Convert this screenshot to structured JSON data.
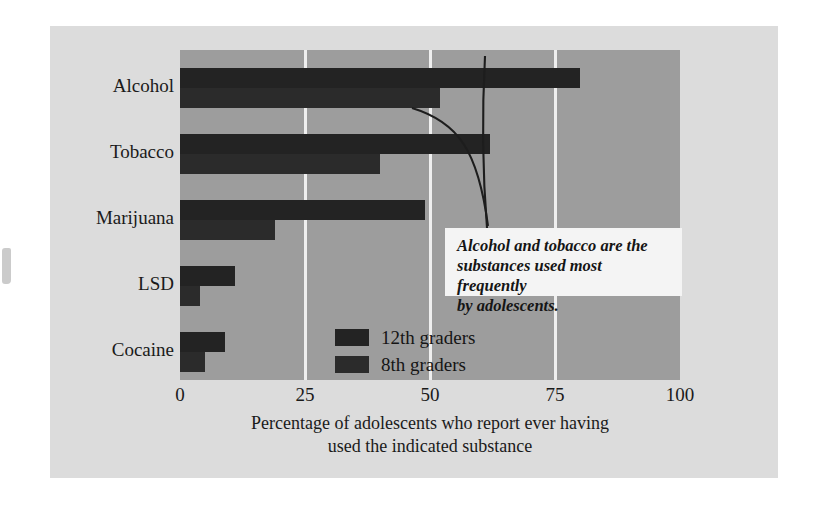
{
  "chart_data": {
    "type": "bar",
    "orientation": "horizontal",
    "title": "",
    "xlabel": "Percentage of adolescents who report ever having used the indicated substance",
    "xlabel_line1": "Percentage of adolescents who report ever having",
    "xlabel_line2": "used the indicated substance",
    "ylabel": "",
    "categories": [
      "Alcohol",
      "Tobacco",
      "Marijuana",
      "LSD",
      "Cocaine"
    ],
    "series": [
      {
        "name": "12th graders",
        "values": [
          80,
          62,
          49,
          11,
          9
        ],
        "color": "#232323"
      },
      {
        "name": "8th graders",
        "values": [
          52,
          40,
          19,
          4,
          5
        ],
        "color": "#2b2b2b"
      }
    ],
    "xlim": [
      0,
      100
    ],
    "xticks": [
      0,
      25,
      50,
      75,
      100
    ],
    "xtick_labels": [
      "0",
      "25",
      "50",
      "75",
      "100"
    ],
    "grid": true,
    "gridline_values": [
      25,
      50,
      75
    ],
    "gridline_color": "#efefef",
    "legend_position": "inside-center-lower",
    "plot_background": "#9d9d9d",
    "figure_background": "#dcdcdc",
    "page_background": "#ffffff",
    "annotations": [
      {
        "text": "Alcohol and tobacco are the substances used most frequently by adolescents.",
        "line1": "Alcohol and tobacco are the",
        "line2": "substances used most frequently",
        "line3": "by adolescents.",
        "style": "bold-italic",
        "box_background": "#f4f4f4",
        "points_to": [
          "Tobacco 12th graders bar",
          "Alcohol 12th graders bar"
        ]
      }
    ]
  },
  "legend": {
    "items": [
      {
        "label": "12th graders",
        "swatch": "#232323"
      },
      {
        "label": "8th graders",
        "swatch": "#2b2b2b"
      }
    ]
  }
}
